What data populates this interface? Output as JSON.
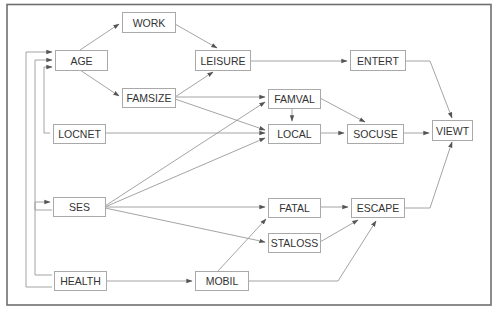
{
  "diagram": {
    "type": "path-model",
    "colors": {
      "frame": "#6f6f6f",
      "edge": "#9a9a9a",
      "node_border": "#a9a9a9",
      "text": "#333333",
      "background": "#ffffff"
    },
    "nodes": [
      {
        "id": "AGE",
        "label": "AGE",
        "x": 55,
        "y": 50,
        "w": 52,
        "h": 20
      },
      {
        "id": "WORK",
        "label": "WORK",
        "x": 122,
        "y": 12,
        "w": 53,
        "h": 20
      },
      {
        "id": "FAMSIZE",
        "label": "FAMSIZE",
        "x": 122,
        "y": 88,
        "w": 53,
        "h": 19
      },
      {
        "id": "LEISURE",
        "label": "LEISURE",
        "x": 195,
        "y": 50,
        "w": 55,
        "h": 20
      },
      {
        "id": "ENTERT",
        "label": "ENTERT",
        "x": 350,
        "y": 50,
        "w": 55,
        "h": 20
      },
      {
        "id": "LOCNET",
        "label": "LOCNET",
        "x": 53,
        "y": 124,
        "w": 52,
        "h": 19
      },
      {
        "id": "FAMVAL",
        "label": "FAMVAL",
        "x": 268,
        "y": 89,
        "w": 52,
        "h": 19
      },
      {
        "id": "LOCAL",
        "label": "LOCAL",
        "x": 268,
        "y": 124,
        "w": 52,
        "h": 19
      },
      {
        "id": "SOCUSE",
        "label": "SOCUSE",
        "x": 347,
        "y": 124,
        "w": 56,
        "h": 19
      },
      {
        "id": "VIEWT",
        "label": "VIEWT",
        "x": 432,
        "y": 120,
        "w": 40,
        "h": 20
      },
      {
        "id": "SES",
        "label": "SES",
        "x": 53,
        "y": 197,
        "w": 52,
        "h": 19
      },
      {
        "id": "FATAL",
        "label": "FATAL",
        "x": 268,
        "y": 198,
        "w": 52,
        "h": 19
      },
      {
        "id": "ESCAPE",
        "label": "ESCAPE",
        "x": 351,
        "y": 198,
        "w": 53,
        "h": 19
      },
      {
        "id": "STALOSS",
        "label": "STALOSS",
        "x": 268,
        "y": 233,
        "w": 52,
        "h": 19
      },
      {
        "id": "HEALTH",
        "label": "HEALTH",
        "x": 54,
        "y": 271,
        "w": 52,
        "h": 19
      },
      {
        "id": "MOBIL",
        "label": "MOBIL",
        "x": 195,
        "y": 271,
        "w": 53,
        "h": 19
      }
    ],
    "edges": [
      {
        "from": "AGE",
        "to": "WORK",
        "d": "M80,50 L119,24"
      },
      {
        "from": "AGE",
        "to": "FAMSIZE",
        "d": "M80,70 L119,96"
      },
      {
        "from": "WORK",
        "to": "LEISURE",
        "d": "M175,24 L217,48"
      },
      {
        "from": "FAMSIZE",
        "to": "LEISURE",
        "d": "M175,97 L213,72"
      },
      {
        "from": "LEISURE",
        "to": "ENTERT",
        "d": "M250,61 L347,61"
      },
      {
        "from": "ENTERT",
        "to": "VIEWT",
        "d": "M405,61 L430,61 L452,118"
      },
      {
        "from": "FAMSIZE",
        "to": "FAMVAL",
        "d": "M175,97 L265,97"
      },
      {
        "from": "FAMSIZE",
        "to": "LOCAL",
        "d": "M175,99 L265,130"
      },
      {
        "from": "LOCNET",
        "to": "LOCAL",
        "d": "M105,133 L265,133"
      },
      {
        "from": "FAMVAL",
        "to": "LOCAL",
        "d": "M292,108 L292,121"
      },
      {
        "from": "FAMVAL",
        "to": "SOCUSE",
        "d": "M320,98 L365,122"
      },
      {
        "from": "LOCAL",
        "to": "SOCUSE",
        "d": "M320,133 L344,133"
      },
      {
        "from": "SOCUSE",
        "to": "VIEWT",
        "d": "M403,133 L429,133"
      },
      {
        "from": "SES",
        "to": "FAMVAL",
        "d": "M105,206 L265,102"
      },
      {
        "from": "SES",
        "to": "LOCAL",
        "d": "M105,207 L265,138"
      },
      {
        "from": "SES",
        "to": "FATAL",
        "d": "M105,207 L265,207"
      },
      {
        "from": "SES",
        "to": "STALOSS",
        "d": "M105,208 L265,242"
      },
      {
        "from": "MOBIL",
        "to": "FATAL",
        "d": "M218,271 L266,219"
      },
      {
        "from": "FATAL",
        "to": "ESCAPE",
        "d": "M320,207 L348,207"
      },
      {
        "from": "STALOSS",
        "to": "ESCAPE",
        "d": "M320,242 L358,220"
      },
      {
        "from": "MOBIL",
        "to": "ESCAPE",
        "d": "M248,281 L338,281 L376,221"
      },
      {
        "from": "ESCAPE",
        "to": "VIEWT",
        "d": "M404,208 L430,208 L452,142"
      },
      {
        "from": "HEALTH",
        "to": "MOBIL",
        "d": "M106,281 L192,281"
      },
      {
        "from": "HEALTH",
        "to": "AGE",
        "d": "M52,287 L26,287 L26,52 L52,52"
      },
      {
        "from": "SES",
        "to": "AGE",
        "d": "M52,210 L35,210 L35,60 L52,60"
      },
      {
        "from": "LOCNET",
        "to": "AGE",
        "d": "M50,133 L44,133 L44,67 L52,67"
      },
      {
        "from": "HEALTH",
        "to": "SES",
        "d": "M52,275 L35,275 L35,202 L50,202"
      }
    ]
  }
}
